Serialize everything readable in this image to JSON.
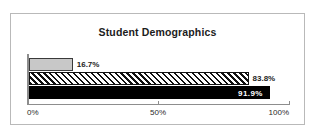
{
  "chart_data": {
    "type": "bar",
    "orientation": "horizontal",
    "title": "Student Demographics",
    "xlabel": "",
    "ylabel": "",
    "xlim": [
      0,
      100
    ],
    "grid": false,
    "legend": false,
    "categories": [
      "",
      "",
      ""
    ],
    "values": [
      16.7,
      83.8,
      91.9
    ],
    "value_labels": [
      "16.7%",
      "83.8%",
      "91.9%"
    ],
    "x_ticks": [
      0,
      50,
      100
    ],
    "x_tick_labels": [
      "0%",
      "50%",
      "100%"
    ],
    "series_styles": [
      "light-gray-solid",
      "black-diagonal-hatch",
      "solid-black"
    ],
    "label_placement": [
      "outside",
      "outside",
      "inside"
    ],
    "colors": {
      "bar_gray": "#c8c8c8",
      "bar_black": "#000000",
      "hatch_line": "#111111",
      "axis": "#8d8d8d",
      "frame": "#b9b9b9",
      "text": "#1c1c1c",
      "inside_label_text": "#ffffff",
      "background": "#ffffff"
    }
  }
}
